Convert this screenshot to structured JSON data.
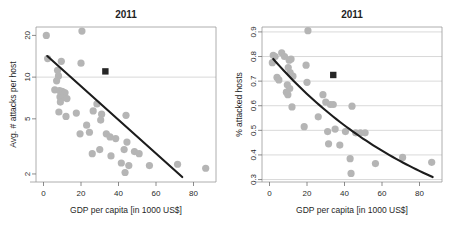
{
  "figure": {
    "background": "#ffffff",
    "point_color": "#b5b5b5",
    "trend_color": "#1c1c1c",
    "marker_color": "#262626",
    "grid_color": "#c9c9c9"
  },
  "chart_data": [
    {
      "type": "scatter",
      "panel": "left",
      "title": "2011",
      "xlabel": "GDP per capita [in 1000 US$]",
      "ylabel": "Avg. # attacks per host",
      "yscale": "log",
      "xlim": [
        -4,
        92
      ],
      "ylim": [
        1.75,
        23
      ],
      "xticks": [
        0,
        20,
        40,
        60,
        80
      ],
      "yticks": [
        2,
        5,
        10,
        20
      ],
      "xticklabels": [
        "0",
        "20",
        "40",
        "60",
        "80"
      ],
      "yticklabels": [
        "2",
        "5",
        "10",
        "20"
      ],
      "grid": "horizontal-at-10",
      "gridlines": [
        10
      ],
      "legend": "none",
      "points": [
        {
          "x": 1.5,
          "y": 20.0
        },
        {
          "x": 20.5,
          "y": 21.5
        },
        {
          "x": 2.2,
          "y": 13.6
        },
        {
          "x": 9.5,
          "y": 13.0
        },
        {
          "x": 20.0,
          "y": 12.6
        },
        {
          "x": 7.5,
          "y": 11.2
        },
        {
          "x": 8.0,
          "y": 10.2
        },
        {
          "x": 7.0,
          "y": 9.4
        },
        {
          "x": 6.0,
          "y": 8.1
        },
        {
          "x": 8.5,
          "y": 8.0
        },
        {
          "x": 9.8,
          "y": 7.9
        },
        {
          "x": 10.5,
          "y": 7.8
        },
        {
          "x": 11.5,
          "y": 7.7
        },
        {
          "x": 8.8,
          "y": 7.2
        },
        {
          "x": 10.2,
          "y": 7.1
        },
        {
          "x": 12.5,
          "y": 7.0
        },
        {
          "x": 9.0,
          "y": 6.6
        },
        {
          "x": 28.5,
          "y": 6.4
        },
        {
          "x": 8.2,
          "y": 5.6
        },
        {
          "x": 17.5,
          "y": 5.5
        },
        {
          "x": 26.5,
          "y": 5.7
        },
        {
          "x": 31.0,
          "y": 5.4
        },
        {
          "x": 44.0,
          "y": 5.3
        },
        {
          "x": 12.0,
          "y": 5.2
        },
        {
          "x": 30.5,
          "y": 4.9
        },
        {
          "x": 23.0,
          "y": 4.5
        },
        {
          "x": 24.5,
          "y": 4.0
        },
        {
          "x": 19.5,
          "y": 3.9
        },
        {
          "x": 33.5,
          "y": 3.9
        },
        {
          "x": 35.5,
          "y": 3.7
        },
        {
          "x": 38.5,
          "y": 3.6
        },
        {
          "x": 44.5,
          "y": 3.4
        },
        {
          "x": 30.0,
          "y": 3.0
        },
        {
          "x": 43.0,
          "y": 3.0
        },
        {
          "x": 26.0,
          "y": 2.8
        },
        {
          "x": 36.0,
          "y": 2.7
        },
        {
          "x": 48.5,
          "y": 2.9
        },
        {
          "x": 51.0,
          "y": 2.8
        },
        {
          "x": 41.5,
          "y": 2.4
        },
        {
          "x": 45.5,
          "y": 2.3
        },
        {
          "x": 56.5,
          "y": 2.3
        },
        {
          "x": 71.5,
          "y": 2.35
        },
        {
          "x": 86.5,
          "y": 2.2
        },
        {
          "x": 43.5,
          "y": 2.05
        }
      ],
      "highlight_point": {
        "x": 33.0,
        "y": 11.0,
        "marker": "square"
      },
      "trend": {
        "type": "log-linear",
        "x_start": 2.0,
        "y_start": 14.2,
        "x_end": 74.0,
        "y_end": 1.9
      }
    },
    {
      "type": "scatter",
      "panel": "right",
      "title": "2011",
      "xlabel": "GDP per capita [in 1000 US$]",
      "ylabel": "% attacked hosts",
      "yscale": "linear",
      "xlim": [
        -4,
        92
      ],
      "ylim": [
        0.29,
        0.92
      ],
      "xticks": [
        0,
        20,
        40,
        60,
        80
      ],
      "yticks": [
        0.3,
        0.4,
        0.5,
        0.6,
        0.7,
        0.8,
        0.9
      ],
      "xticklabels": [
        "0",
        "20",
        "40",
        "60",
        "80"
      ],
      "yticklabels": [
        "0.3",
        "0.4",
        "0.5",
        "0.6",
        "0.7",
        "0.8",
        "0.9"
      ],
      "grid": "horizontal",
      "gridlines": [
        0.3,
        0.4,
        0.5,
        0.6,
        0.7,
        0.8,
        0.9
      ],
      "legend": "none",
      "points": [
        {
          "x": 20.5,
          "y": 0.905
        },
        {
          "x": 2.0,
          "y": 0.805
        },
        {
          "x": 3.0,
          "y": 0.8
        },
        {
          "x": 6.5,
          "y": 0.815
        },
        {
          "x": 8.0,
          "y": 0.8
        },
        {
          "x": 1.5,
          "y": 0.775
        },
        {
          "x": 10.5,
          "y": 0.785
        },
        {
          "x": 11.5,
          "y": 0.79
        },
        {
          "x": 19.5,
          "y": 0.765
        },
        {
          "x": 10.0,
          "y": 0.755
        },
        {
          "x": 11.0,
          "y": 0.735
        },
        {
          "x": 12.5,
          "y": 0.72
        },
        {
          "x": 4.0,
          "y": 0.715
        },
        {
          "x": 5.0,
          "y": 0.705
        },
        {
          "x": 20.0,
          "y": 0.695
        },
        {
          "x": 9.5,
          "y": 0.685
        },
        {
          "x": 10.8,
          "y": 0.67
        },
        {
          "x": 9.0,
          "y": 0.655
        },
        {
          "x": 9.8,
          "y": 0.645
        },
        {
          "x": 28.5,
          "y": 0.645
        },
        {
          "x": 12.0,
          "y": 0.595
        },
        {
          "x": 30.0,
          "y": 0.615
        },
        {
          "x": 32.5,
          "y": 0.605
        },
        {
          "x": 34.0,
          "y": 0.605
        },
        {
          "x": 44.0,
          "y": 0.598
        },
        {
          "x": 26.0,
          "y": 0.555
        },
        {
          "x": 18.5,
          "y": 0.515
        },
        {
          "x": 35.0,
          "y": 0.505
        },
        {
          "x": 31.0,
          "y": 0.495
        },
        {
          "x": 40.5,
          "y": 0.495
        },
        {
          "x": 46.0,
          "y": 0.49
        },
        {
          "x": 48.5,
          "y": 0.49
        },
        {
          "x": 51.0,
          "y": 0.49
        },
        {
          "x": 31.5,
          "y": 0.445
        },
        {
          "x": 37.5,
          "y": 0.44
        },
        {
          "x": 43.0,
          "y": 0.385
        },
        {
          "x": 56.5,
          "y": 0.365
        },
        {
          "x": 71.0,
          "y": 0.39
        },
        {
          "x": 86.5,
          "y": 0.37
        },
        {
          "x": 43.5,
          "y": 0.325
        }
      ],
      "highlight_point": {
        "x": 34.0,
        "y": 0.725,
        "marker": "square"
      },
      "trend": {
        "type": "exponential-decay",
        "x_start": 2.0,
        "y_start": 0.79,
        "x_end": 87.0,
        "y_end": 0.31
      }
    }
  ]
}
